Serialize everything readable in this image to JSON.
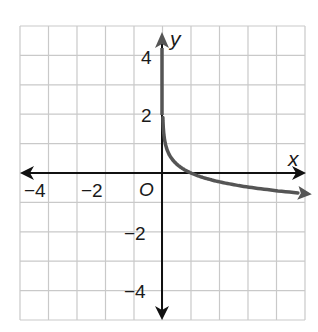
{
  "chart_data": {
    "type": "line",
    "title": "",
    "xlabel": "x",
    "ylabel": "y",
    "origin_label": "O",
    "xlim": [
      -5,
      5
    ],
    "ylim": [
      -5,
      5
    ],
    "grid": true,
    "grid_step": 1,
    "x_ticks": [
      -4,
      -2
    ],
    "x_tick_labels": [
      "−4",
      "−2"
    ],
    "y_ticks": [
      4,
      2,
      -2,
      -4
    ],
    "y_tick_labels": [
      "4",
      "2",
      "−2",
      "−4"
    ],
    "series": [
      {
        "name": "curve",
        "description": "decreasing logarithmic curve, vertical asymptote x = 0, crosses x-axis at (1, 0)",
        "x": [
          0.01,
          0.05,
          0.1,
          0.2,
          0.5,
          1,
          2,
          3,
          4,
          5
        ],
        "y": [
          2,
          1.3,
          1,
          0.7,
          0.3,
          0,
          -0.3,
          -0.48,
          -0.6,
          -0.7
        ]
      }
    ],
    "colors": {
      "curve": "#555555",
      "axes": "#111111",
      "grid": "#c8c8c8"
    }
  }
}
